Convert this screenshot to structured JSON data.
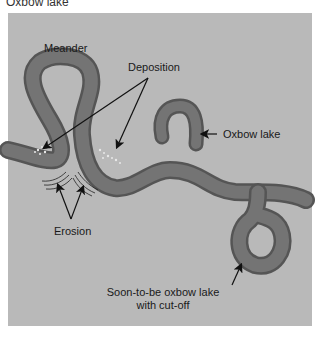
{
  "title": "Oxbow lake",
  "labels": {
    "meander": "Meander",
    "deposition": "Deposition",
    "oxbow_lake": "Oxbow lake",
    "erosion": "Erosion",
    "soon_line1": "Soon-to-be oxbow lake",
    "soon_line2": "with cut-off"
  },
  "colors": {
    "background": "#b9b9b9",
    "river": "#6f6f6f",
    "river_edge": "#555555",
    "text": "#1a1a1a"
  }
}
